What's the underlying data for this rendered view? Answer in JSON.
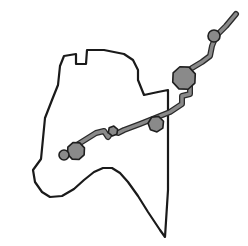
{
  "figure": {
    "background_color": "#ffffff",
    "width": 248,
    "height": 246
  },
  "colors": {
    "outline_stroke": "#1a1a1a",
    "route_stroke": "#2b2b2b",
    "route_fill": "#8a8a8a",
    "node_fill": "#8a8a8a",
    "node_stroke": "#1f1f1f",
    "canvas": "#ffffff"
  },
  "region": {
    "name": "region-boundary",
    "stroke_width": 2.2,
    "path": "M 41 159 L 45 118 L 52 100 L 58 85 L 60 66 L 64 56 L 76 54 L 76 64 L 86 64 L 87 50 L 104 50 L 124 54 L 133 60 L 138 70 L 138 80 L 144 95 L 158 92 L 168 90 L 168 100 L 168 140 L 168 190 L 165 237 L 160 230 L 148 212 L 138 196 L 128 182 L 120 173 L 112 168 L 103 168 L 94 172 L 84 180 L 74 189 L 62 196 L 50 197 L 42 192 L 35 182 L 33 170 Z"
  },
  "route": {
    "name": "route-polyline",
    "stroke_width": 3.4,
    "outer_stroke_width": 6.0,
    "segments": [
      {
        "name": "route-segment-northeast",
        "path": "M 236 14 L 226 26 L 216 36 L 212 46 L 210 56 L 202 62 L 192 68"
      },
      {
        "name": "route-segment-spur",
        "path": "M 190 84 L 190 94 L 182 96 L 182 104 L 176 108 L 170 112 L 160 116 L 150 120 L 140 124 L 132 127 L 124 130 L 118 133 L 112 131 L 108 137 L 104 131 L 96 133 L 88 138 L 80 143 L 72 148"
      }
    ]
  },
  "nodes": [
    {
      "name": "node-major-junction",
      "shape": "polygon",
      "cx": 184,
      "cy": 78,
      "radius": 12,
      "sides": 8
    },
    {
      "name": "node-northeast-stop",
      "shape": "circle",
      "cx": 214,
      "cy": 36,
      "radius": 6
    },
    {
      "name": "node-mid-crossing",
      "shape": "polygon",
      "cx": 156,
      "cy": 124,
      "radius": 8,
      "sides": 7
    },
    {
      "name": "node-small-bend",
      "shape": "polygon",
      "cx": 113,
      "cy": 131,
      "radius": 5,
      "sides": 6
    },
    {
      "name": "node-west-terminus",
      "shape": "polygon",
      "cx": 76,
      "cy": 151,
      "radius": 9,
      "sides": 8
    },
    {
      "name": "node-isolated-point",
      "shape": "circle",
      "cx": 64,
      "cy": 155,
      "radius": 5
    }
  ],
  "chart_data": {
    "type": "scatter",
    "xlabel": "",
    "ylabel": "",
    "xlim": [
      0,
      248
    ],
    "ylim": [
      0,
      246
    ],
    "grid": false,
    "legend": "none",
    "series": [
      {
        "name": "route-nodes",
        "x": [
          184,
          214,
          156,
          113,
          76,
          64
        ],
        "y": [
          78,
          36,
          124,
          131,
          151,
          155
        ],
        "sizes": [
          12,
          6,
          8,
          5,
          9,
          5
        ],
        "labels": [
          "node-major-junction",
          "node-northeast-stop",
          "node-mid-crossing",
          "node-small-bend",
          "node-west-terminus",
          "node-isolated-point"
        ]
      }
    ],
    "annotations": [
      "closed irregular region boundary drawn as thin black outline",
      "thick gray route polyline entering from upper right and running to lower left",
      "six gray node markers of varying radii placed along or near the route"
    ]
  }
}
